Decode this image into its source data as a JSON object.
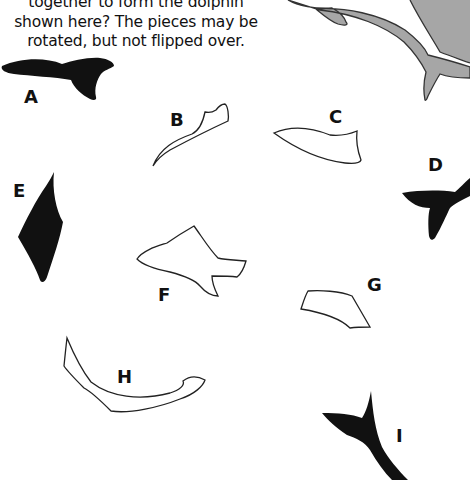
{
  "puzzle": {
    "instructions": [
      "together to form the dolphin",
      "shown here? The pieces may be",
      "rotated, but not flipped over."
    ],
    "dolphin": {
      "fill": "#a6a6a6",
      "stroke": "#333333"
    },
    "pieces": [
      {
        "id": "A",
        "label": "A",
        "style": "filled"
      },
      {
        "id": "B",
        "label": "B",
        "style": "outline"
      },
      {
        "id": "C",
        "label": "C",
        "style": "outline"
      },
      {
        "id": "D",
        "label": "D",
        "style": "filled"
      },
      {
        "id": "E",
        "label": "E",
        "style": "filled"
      },
      {
        "id": "F",
        "label": "F",
        "style": "outline"
      },
      {
        "id": "G",
        "label": "G",
        "style": "outline"
      },
      {
        "id": "H",
        "label": "H",
        "style": "outline"
      },
      {
        "id": "I",
        "label": "I",
        "style": "filled"
      }
    ],
    "colors": {
      "filled_piece": "#111111",
      "outline_stroke": "#222222",
      "background": "#ffffff"
    }
  }
}
